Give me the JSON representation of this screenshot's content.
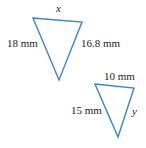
{
  "figure": {
    "stroke_color": "#3b86c6",
    "triangle1": {
      "top_label": "x",
      "left_label": "18 mm",
      "right_label": "16.8 mm",
      "points": "33,18 82,22 59,80"
    },
    "triangle2": {
      "top_label": "10 mm",
      "left_label": "15 mm",
      "right_label": "y",
      "points": "95,84 134,88 118,137"
    }
  }
}
